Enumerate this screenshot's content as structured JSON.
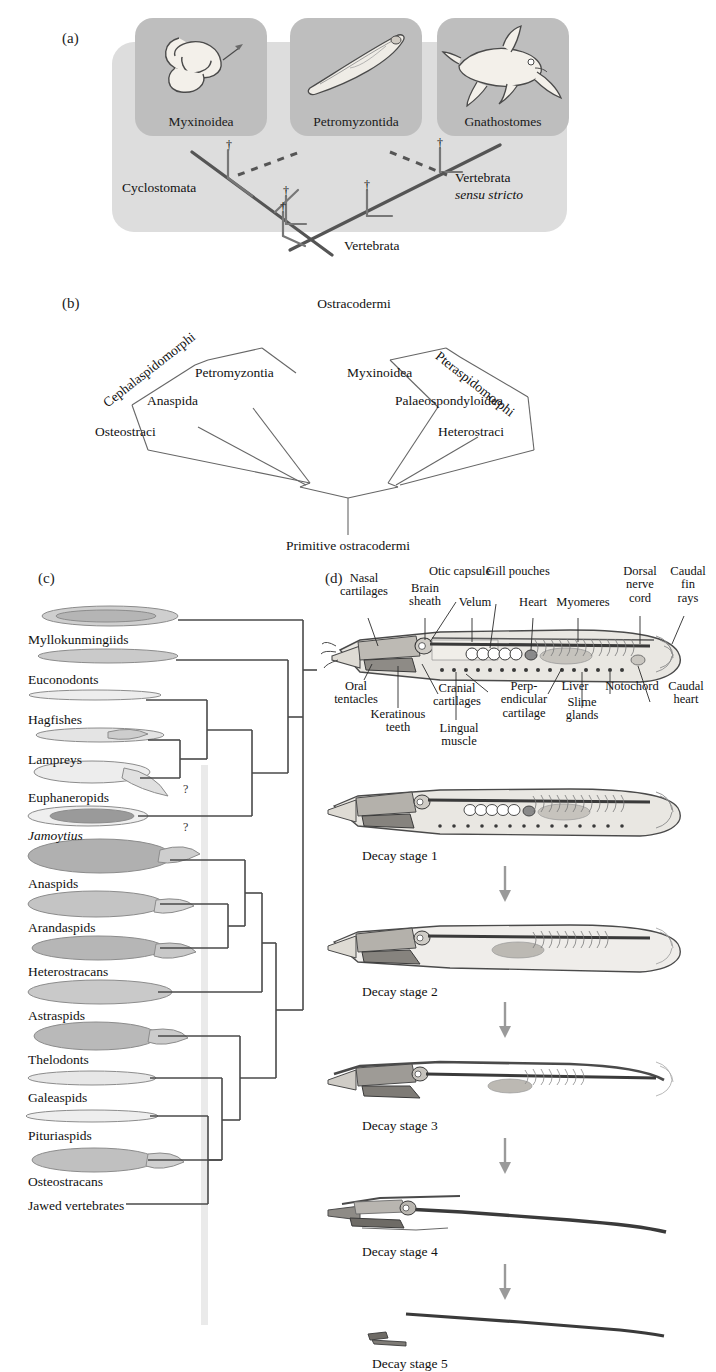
{
  "figure": {
    "panels": [
      "(a)",
      "(b)",
      "(c)",
      "(d)"
    ]
  },
  "panel_a": {
    "label": "(a)",
    "taxa": [
      {
        "name": "Myxinoidea",
        "icon": "hagfish-illustration"
      },
      {
        "name": "Petromyzontida",
        "icon": "lamprey-illustration"
      },
      {
        "name": "Gnathostomes",
        "icon": "jawed-fish-illustration"
      }
    ],
    "clades": {
      "cyclostomata": "Cyclostomata",
      "vertebrata_sensu_stricto_line1": "Vertebrata",
      "vertebrata_sensu_stricto_line2": "sensu stricto",
      "vertebrata": "Vertebrata"
    },
    "extinct_marker": "†",
    "extinct_marker_count": 4,
    "colors": {
      "outer_box": "#dddddd",
      "inner_box": "#bebebe",
      "branch": "#555555"
    }
  },
  "panel_b": {
    "label": "(b)",
    "title": "Ostracodermi",
    "root": "Primitive ostracodermi",
    "left_group": "Cephalaspidomorphi",
    "right_group": "Pteraspidomorphi",
    "tips_left": [
      "Osteostraci",
      "Anaspida",
      "Petromyzontia"
    ],
    "tips_right": [
      "Myxinoidea",
      "Palaeospondyloidea",
      "Heterostraci"
    ]
  },
  "panel_c": {
    "label": "(c)",
    "uncertainty_marker": "?",
    "uncertainty_count": 2,
    "taxa": [
      {
        "label": "Myllokunmingiids"
      },
      {
        "label": "Euconodonts"
      },
      {
        "label": "Hagfishes"
      },
      {
        "label": "Lampreys"
      },
      {
        "label": "Euphaneropids"
      },
      {
        "label": "Jamoytius",
        "italic": true
      },
      {
        "label": "Anaspids"
      },
      {
        "label": "Arandaspids"
      },
      {
        "label": "Heterostracans"
      },
      {
        "label": "Astraspids"
      },
      {
        "label": "Thelodonts"
      },
      {
        "label": "Galeaspids"
      },
      {
        "label": "Pituriaspids"
      },
      {
        "label": "Osteostracans"
      },
      {
        "label": "Jawed vertebrates"
      }
    ]
  },
  "panel_d": {
    "label": "(d)",
    "anatomy_labels": [
      {
        "id": "nasal-cartilages",
        "text": "Nasal\ncartilages"
      },
      {
        "id": "brain-sheath",
        "text": "Brain\nsheath"
      },
      {
        "id": "otic-capsule",
        "text": "Otic capsule"
      },
      {
        "id": "velum",
        "text": "Velum"
      },
      {
        "id": "gill-pouches",
        "text": "Gill pouches"
      },
      {
        "id": "heart",
        "text": "Heart"
      },
      {
        "id": "myomeres",
        "text": "Myomeres"
      },
      {
        "id": "dorsal-nerve-cord",
        "text": "Dorsal\nnerve\ncord"
      },
      {
        "id": "caudal-fin-rays",
        "text": "Caudal\nfin\nrays"
      },
      {
        "id": "oral-tentacles",
        "text": "Oral\ntentacles"
      },
      {
        "id": "keratinous-teeth",
        "text": "Keratinous\nteeth"
      },
      {
        "id": "cranial-cartilages",
        "text": "Cranial\ncartilages"
      },
      {
        "id": "lingual-muscle",
        "text": "Lingual\nmuscle"
      },
      {
        "id": "perpendicular-cartilage",
        "text": "Perp-\nendicular\ncartilage"
      },
      {
        "id": "liver",
        "text": "Liver"
      },
      {
        "id": "slime-glands",
        "text": "Slime\nglands"
      },
      {
        "id": "notochord",
        "text": "Notochord"
      },
      {
        "id": "caudal-heart",
        "text": "Caudal\nheart"
      }
    ],
    "decay_stages": [
      "Decay stage 1",
      "Decay stage 2",
      "Decay stage 3",
      "Decay stage 4",
      "Decay stage 5"
    ]
  }
}
